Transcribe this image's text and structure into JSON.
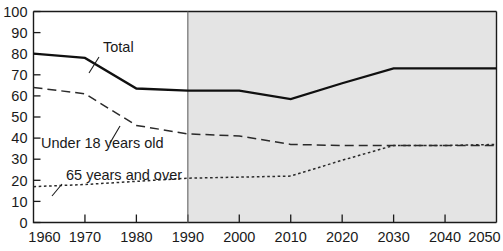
{
  "chart_data": {
    "type": "line",
    "title": "",
    "subtitle": "",
    "xlabel": "",
    "ylabel": "",
    "xlim": [
      1960,
      2050
    ],
    "ylim": [
      0,
      100
    ],
    "grid": false,
    "legend_position": "inline-annotations",
    "x_tick_labels": [
      "1960",
      "1970",
      "1980",
      "1990",
      "2000",
      "2010",
      "2020",
      "2030",
      "2040",
      "2050"
    ],
    "x_ticks": [
      1960,
      1970,
      1980,
      1990,
      2000,
      2010,
      2020,
      2030,
      2040,
      2050
    ],
    "y_tick_labels": [
      "0",
      "10",
      "20",
      "30",
      "40",
      "50",
      "60",
      "70",
      "80",
      "90",
      "100"
    ],
    "y_ticks": [
      0,
      10,
      20,
      30,
      40,
      50,
      60,
      70,
      80,
      90,
      100
    ],
    "projection_start": 1990,
    "projection_shading": "#e4e4e4",
    "series": [
      {
        "name": "Total",
        "style": "solid",
        "color": "#101010",
        "x": [
          1960,
          1970,
          1980,
          1990,
          2000,
          2010,
          2020,
          2030,
          2040,
          2050
        ],
        "values": [
          80,
          78,
          63.5,
          62.5,
          62.5,
          58.5,
          66,
          73,
          73,
          73
        ]
      },
      {
        "name": "Under 18 years old",
        "style": "dashed",
        "color": "#2a2a2a",
        "x": [
          1960,
          1970,
          1980,
          1990,
          2000,
          2010,
          2020,
          2030,
          2040,
          2050
        ],
        "values": [
          64,
          61,
          46,
          42,
          41,
          37,
          36.5,
          36.5,
          36.5,
          36.5
        ]
      },
      {
        "name": "65 years and over",
        "style": "dotted",
        "color": "#2a2a2a",
        "x": [
          1960,
          1970,
          1980,
          1990,
          2000,
          2010,
          2020,
          2030,
          2040,
          2050
        ],
        "values": [
          17,
          18,
          19.5,
          21,
          21.5,
          22,
          29.5,
          36.5,
          36.5,
          37
        ]
      }
    ],
    "annotations": [
      {
        "text": "Total",
        "label_x": 103,
        "label_y": 52,
        "leader": [
          [
            99,
            57
          ],
          [
            89,
            73
          ]
        ]
      },
      {
        "text": "Under 18 years old",
        "label_x": 41,
        "label_y": 148,
        "leader": [
          [
            110,
            143
          ],
          [
            120,
            126
          ]
        ]
      },
      {
        "text": "65 years and over",
        "label_x": 66,
        "label_y": 180,
        "leader": [
          [
            62,
            184
          ],
          [
            52,
            196
          ]
        ]
      }
    ]
  }
}
